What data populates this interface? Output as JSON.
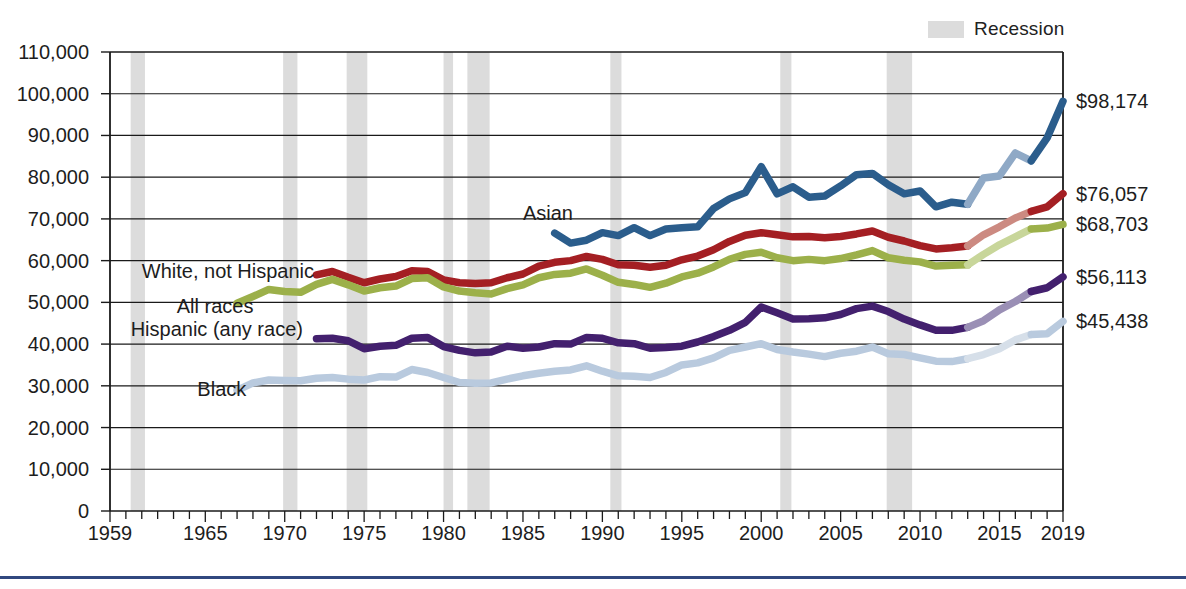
{
  "legend": {
    "recession_label": "Recession",
    "recession_color": "#dcdcdc"
  },
  "clipped_title": "",
  "axes": {
    "y_ticks": [
      "110,000",
      "100,000",
      "90,000",
      "80,000",
      "70,000",
      "60,000",
      "50,000",
      "40,000",
      "30,000",
      "20,000",
      "10,000",
      "0"
    ],
    "y_tick_values": [
      110000,
      100000,
      90000,
      80000,
      70000,
      60000,
      50000,
      40000,
      30000,
      20000,
      10000,
      0
    ],
    "x_ticks": [
      "1959",
      "1965",
      "1970",
      "1975",
      "1980",
      "1985",
      "1990",
      "1995",
      "2000",
      "2005",
      "2010",
      "2015",
      "2019"
    ],
    "x_tick_values": [
      1959,
      1965,
      1970,
      1975,
      1980,
      1985,
      1990,
      1995,
      2000,
      2005,
      2010,
      2015,
      2019
    ]
  },
  "end_labels": [
    {
      "text": "$98,174",
      "value": 98174,
      "series": "Asian"
    },
    {
      "text": "$76,057",
      "value": 76057,
      "series": "White, not Hispanic"
    },
    {
      "text": "$68,703",
      "value": 68703,
      "series": "All races"
    },
    {
      "text": "$56,113",
      "value": 56113,
      "series": "Hispanic (any race)"
    },
    {
      "text": "$45,438",
      "value": 45438,
      "series": "Black"
    }
  ],
  "series_labels": [
    {
      "text": "Asian",
      "x": 1985.0,
      "y": 71500
    },
    {
      "text": "White, not Hispanic",
      "x": 1961.0,
      "y": 57600
    },
    {
      "text": "All races",
      "x": 1963.2,
      "y": 49100
    },
    {
      "text": "Hispanic (any race)",
      "x": 1960.3,
      "y": 43600
    },
    {
      "text": "Black",
      "x": 1964.5,
      "y": 29200
    }
  ],
  "chart_data": {
    "type": "line",
    "xlabel": "",
    "ylabel": "",
    "xlim": [
      1959,
      2019
    ],
    "ylim": [
      0,
      110000
    ],
    "grid": true,
    "legend_position": "top-right",
    "y_tick_step": 10000,
    "note": "Lighter-toned segments between 2013 and 2017 indicate a survey redesign / methodology break.",
    "colors": {
      "asian": "#2b5d8c",
      "asian_light": "#8fa9c6",
      "white_not_hispanic": "#a41f23",
      "white_not_hispanic_light": "#cc8a81",
      "all_races": "#9bb councils",
      "all_races_solid": "#9cb04a",
      "all_races_light": "#c8d69a",
      "hispanic": "#43206e",
      "hispanic_light": "#9a8fb5",
      "black": "#b9cade",
      "black_light": "#d6dfe9",
      "recession_band": "#dcdcdc",
      "axis": "#1a1a1a",
      "bottom_rule": "#31487f"
    },
    "recessions": [
      {
        "start": 1960.3,
        "end": 1961.2
      },
      {
        "start": 1969.9,
        "end": 1970.8
      },
      {
        "start": 1973.9,
        "end": 1975.2
      },
      {
        "start": 1980.0,
        "end": 1980.6
      },
      {
        "start": 1981.5,
        "end": 1982.9
      },
      {
        "start": 1990.5,
        "end": 1991.2
      },
      {
        "start": 2001.2,
        "end": 2001.9
      },
      {
        "start": 2007.9,
        "end": 2009.5
      }
    ],
    "series": [
      {
        "name": "Asian",
        "color": "#2b5d8c",
        "light_color": "#8fa9c6",
        "break_start": 2013,
        "break_end": 2017,
        "x": [
          1987,
          1988,
          1989,
          1990,
          1991,
          1992,
          1993,
          1994,
          1995,
          1996,
          1997,
          1998,
          1999,
          2000,
          2001,
          2002,
          2003,
          2004,
          2005,
          2006,
          2007,
          2008,
          2009,
          2010,
          2011,
          2012,
          2013,
          2014,
          2015,
          2016,
          2017,
          2018,
          2019
        ],
        "values": [
          66600,
          64200,
          64900,
          66700,
          66000,
          67900,
          66000,
          67600,
          67900,
          68100,
          72500,
          74800,
          76300,
          82500,
          76000,
          77700,
          75200,
          75500,
          77900,
          80600,
          80900,
          78200,
          76000,
          76700,
          72900,
          74000,
          73500,
          79800,
          80300,
          85800,
          83900,
          89400,
          98174
        ]
      },
      {
        "name": "White, not Hispanic",
        "color": "#a41f23",
        "light_color": "#cc8a81",
        "break_start": 2013,
        "break_end": 2017,
        "x": [
          1972,
          1973,
          1974,
          1975,
          1976,
          1977,
          1978,
          1979,
          1980,
          1981,
          1982,
          1983,
          1984,
          1985,
          1986,
          1987,
          1988,
          1989,
          1990,
          1991,
          1992,
          1993,
          1994,
          1995,
          1996,
          1997,
          1998,
          1999,
          2000,
          2001,
          2002,
          2003,
          2004,
          2005,
          2006,
          2007,
          2008,
          2009,
          2010,
          2011,
          2012,
          2013,
          2014,
          2015,
          2016,
          2017,
          2018,
          2019
        ],
        "values": [
          56600,
          57400,
          56000,
          54700,
          55600,
          56200,
          57600,
          57400,
          55400,
          54700,
          54500,
          54700,
          55900,
          56800,
          58700,
          59600,
          60000,
          61000,
          60300,
          59000,
          58900,
          58400,
          58900,
          60200,
          61100,
          62600,
          64600,
          66100,
          66700,
          66200,
          65700,
          65800,
          65500,
          65800,
          66400,
          67100,
          65600,
          64700,
          63600,
          62800,
          63100,
          63500,
          66200,
          68100,
          70200,
          71800,
          72900,
          76057
        ]
      },
      {
        "name": "All races",
        "color": "#9cb04a",
        "light_color": "#c8d69a",
        "break_start": 2013,
        "break_end": 2017,
        "x": [
          1967,
          1968,
          1969,
          1970,
          1971,
          1972,
          1973,
          1974,
          1975,
          1976,
          1977,
          1978,
          1979,
          1980,
          1981,
          1982,
          1983,
          1984,
          1985,
          1986,
          1987,
          1988,
          1989,
          1990,
          1991,
          1992,
          1993,
          1994,
          1995,
          1996,
          1997,
          1998,
          1999,
          2000,
          2001,
          2002,
          2003,
          2004,
          2005,
          2006,
          2007,
          2008,
          2009,
          2010,
          2011,
          2012,
          2013,
          2014,
          2015,
          2016,
          2017,
          2018,
          2019
        ],
        "values": [
          49800,
          51400,
          53100,
          52600,
          52400,
          54300,
          55500,
          54200,
          52700,
          53500,
          53900,
          55700,
          55900,
          53700,
          52700,
          52300,
          52000,
          53300,
          54200,
          55900,
          56700,
          57000,
          58000,
          56500,
          54800,
          54300,
          53600,
          54600,
          56100,
          57000,
          58500,
          60300,
          61500,
          62000,
          60700,
          60000,
          60300,
          60000,
          60500,
          61400,
          62400,
          60700,
          60100,
          59700,
          58700,
          58900,
          59000,
          61500,
          63800,
          65700,
          67600,
          67800,
          68703
        ]
      },
      {
        "name": "Hispanic (any race)",
        "color": "#43206e",
        "light_color": "#9a8fb5",
        "break_start": 2013,
        "break_end": 2017,
        "x": [
          1972,
          1973,
          1974,
          1975,
          1976,
          1977,
          1978,
          1979,
          1980,
          1981,
          1982,
          1983,
          1984,
          1985,
          1986,
          1987,
          1988,
          1989,
          1990,
          1991,
          1992,
          1993,
          1994,
          1995,
          1996,
          1997,
          1998,
          1999,
          2000,
          2001,
          2002,
          2003,
          2004,
          2005,
          2006,
          2007,
          2008,
          2009,
          2010,
          2011,
          2012,
          2013,
          2014,
          2015,
          2016,
          2017,
          2018,
          2019
        ],
        "values": [
          41300,
          41400,
          40800,
          38900,
          39500,
          39700,
          41400,
          41600,
          39400,
          38500,
          37900,
          38100,
          39500,
          39000,
          39300,
          40100,
          40000,
          41600,
          41400,
          40300,
          40100,
          39000,
          39200,
          39500,
          40500,
          41800,
          43300,
          45200,
          48900,
          47500,
          46000,
          46100,
          46300,
          47100,
          48500,
          49100,
          47800,
          46000,
          44600,
          43300,
          43300,
          44000,
          45600,
          48200,
          50200,
          52600,
          53500,
          56113
        ]
      },
      {
        "name": "Black",
        "color": "#b9cade",
        "light_color": "#d6dfe9",
        "break_start": 2013,
        "break_end": 2017,
        "x": [
          1967,
          1968,
          1969,
          1970,
          1971,
          1972,
          1973,
          1974,
          1975,
          1976,
          1977,
          1978,
          1979,
          1980,
          1981,
          1982,
          1983,
          1984,
          1985,
          1986,
          1987,
          1988,
          1989,
          1990,
          1991,
          1992,
          1993,
          1994,
          1995,
          1996,
          1997,
          1998,
          1999,
          2000,
          2001,
          2002,
          2003,
          2004,
          2005,
          2006,
          2007,
          2008,
          2009,
          2010,
          2011,
          2012,
          2013,
          2014,
          2015,
          2016,
          2017,
          2018,
          2019
        ],
        "values": [
          28900,
          30700,
          31400,
          31300,
          31200,
          31800,
          32000,
          31600,
          31400,
          32200,
          32100,
          33900,
          33200,
          32000,
          30800,
          30600,
          30700,
          31600,
          32400,
          33000,
          33500,
          33800,
          34800,
          33500,
          32400,
          32300,
          32000,
          33200,
          35000,
          35500,
          36700,
          38500,
          39300,
          40100,
          38700,
          38100,
          37600,
          37000,
          37800,
          38300,
          39300,
          37700,
          37500,
          36700,
          35900,
          35800,
          36500,
          37500,
          38900,
          41000,
          42300,
          42500,
          45438
        ]
      }
    ]
  }
}
